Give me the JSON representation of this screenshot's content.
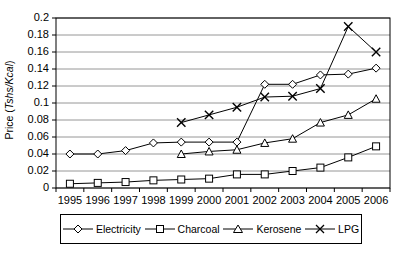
{
  "chart_data": {
    "type": "line",
    "title": "",
    "xlabel": "",
    "ylabel": "Price (Tshs/Kcal)",
    "ylabel_plain": "Price (",
    "ylabel_italic": "Tshs/Kcal",
    "ylabel_tail": ")",
    "categories": [
      1995,
      1996,
      1997,
      1998,
      1999,
      2000,
      2001,
      2002,
      2003,
      2004,
      2005,
      2006
    ],
    "xticklabels": [
      "1995",
      "1996",
      "1997",
      "1998",
      "1999",
      "2000",
      "2001",
      "2002",
      "2003",
      "2004",
      "2005",
      "2006"
    ],
    "yticklabels": [
      "0",
      "0.02",
      "0.04",
      "0.06",
      "0.08",
      "0.1",
      "0.12",
      "0.14",
      "0.16",
      "0.18",
      "0.2"
    ],
    "yticks": [
      0,
      0.02,
      0.04,
      0.06,
      0.08,
      0.1,
      0.12,
      0.14,
      0.16,
      0.18,
      0.2
    ],
    "ylim": [
      0,
      0.2
    ],
    "grid": "horizontal",
    "legend_position": "bottom",
    "series": [
      {
        "name": "Electricity",
        "marker": "diamond",
        "color": "#000000",
        "x": [
          1995,
          1996,
          1997,
          1998,
          1999,
          2000,
          2001,
          2002,
          2003,
          2004,
          2005,
          2006
        ],
        "values": [
          0.04,
          0.04,
          0.044,
          0.053,
          0.054,
          0.054,
          0.054,
          0.122,
          0.122,
          0.133,
          0.134,
          0.141
        ]
      },
      {
        "name": "Charcoal",
        "marker": "square",
        "color": "#000000",
        "x": [
          1995,
          1996,
          1997,
          1998,
          1999,
          2000,
          2001,
          2002,
          2003,
          2004,
          2005,
          2006
        ],
        "values": [
          0.005,
          0.006,
          0.007,
          0.009,
          0.01,
          0.011,
          0.016,
          0.016,
          0.02,
          0.024,
          0.036,
          0.049
        ]
      },
      {
        "name": "Kerosene",
        "marker": "triangle",
        "color": "#000000",
        "x": [
          1999,
          2000,
          2001,
          2002,
          2003,
          2004,
          2005,
          2006
        ],
        "values": [
          0.04,
          0.043,
          0.045,
          0.053,
          0.058,
          0.077,
          0.086,
          0.105
        ]
      },
      {
        "name": "LPG",
        "marker": "cross",
        "color": "#000000",
        "x": [
          1999,
          2000,
          2001,
          2002,
          2003,
          2004,
          2005,
          2006
        ],
        "values": [
          0.077,
          0.086,
          0.095,
          0.107,
          0.108,
          0.117,
          0.19,
          0.16
        ]
      }
    ]
  },
  "legend": {
    "items": [
      {
        "label": "Electricity",
        "marker": "diamond"
      },
      {
        "label": "Charcoal",
        "marker": "square"
      },
      {
        "label": "Kerosene",
        "marker": "triangle"
      },
      {
        "label": "LPG",
        "marker": "cross"
      }
    ]
  }
}
